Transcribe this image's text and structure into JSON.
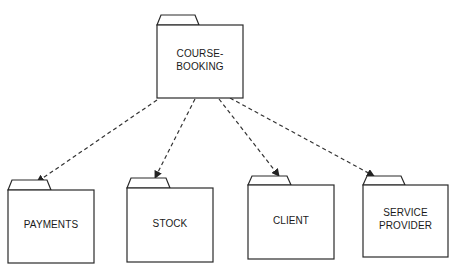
{
  "diagram": {
    "type": "package-dependency",
    "colors": {
      "stroke": "#2a2a2a",
      "background": "#ffffff",
      "text": "#1a1a1a"
    },
    "packages": [
      {
        "id": "course-booking",
        "label": "COURSE-\nBOOKING",
        "x": 157,
        "y": 25,
        "w": 86,
        "h": 73,
        "tab_w": 42,
        "tab_h": 10
      },
      {
        "id": "payments",
        "label": "PAYMENTS",
        "x": 8,
        "y": 190,
        "w": 86,
        "h": 73,
        "tab_w": 43,
        "tab_h": 10
      },
      {
        "id": "stock",
        "label": "STOCK",
        "x": 127,
        "y": 188,
        "w": 86,
        "h": 74,
        "tab_w": 43,
        "tab_h": 10
      },
      {
        "id": "client",
        "label": "CLIENT",
        "x": 248,
        "y": 185,
        "w": 86,
        "h": 74,
        "tab_w": 43,
        "tab_h": 9
      },
      {
        "id": "service-provider",
        "label": "SERVICE\nPROVIDER",
        "x": 363,
        "y": 185,
        "w": 85,
        "h": 72,
        "tab_w": 42,
        "tab_h": 9
      }
    ],
    "dependencies": [
      {
        "from": "course-booking",
        "to": "payments",
        "x1": 157,
        "y1": 100,
        "x2": 37,
        "y2": 182
      },
      {
        "from": "course-booking",
        "to": "stock",
        "x1": 195,
        "y1": 99,
        "x2": 155,
        "y2": 178
      },
      {
        "from": "course-booking",
        "to": "client",
        "x1": 219,
        "y1": 99,
        "x2": 279,
        "y2": 176
      },
      {
        "from": "course-booking",
        "to": "service-provider",
        "x1": 230,
        "y1": 98,
        "x2": 374,
        "y2": 176
      }
    ]
  }
}
